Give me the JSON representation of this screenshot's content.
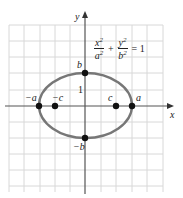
{
  "diagram": {
    "equation": {
      "term1": {
        "num": "x",
        "num_exp": "2",
        "den": "a",
        "den_exp": "2"
      },
      "plus": "+",
      "term2": {
        "num": "y",
        "num_exp": "2",
        "den": "b",
        "den_exp": "2"
      },
      "rhs": "= 1"
    },
    "axes": {
      "x_label": "x",
      "y_label": "y"
    },
    "tick_label": "1",
    "points": [
      {
        "label": "-a",
        "x": -3,
        "y": 0
      },
      {
        "label": "-c",
        "x": -2,
        "y": 0
      },
      {
        "label": "c",
        "x": 2,
        "y": 0
      },
      {
        "label": "a",
        "x": 3,
        "y": 0
      },
      {
        "label": "b",
        "x": 0,
        "y": 2
      },
      {
        "label": "-b",
        "x": 0,
        "y": -2
      }
    ],
    "labels": {
      "neg_a": "−a",
      "neg_c": "−c",
      "c": "c",
      "a": "a",
      "b": "b",
      "neg_b": "−b"
    },
    "colors": {
      "ellipse": "#777777",
      "grid": "#d8d8d8",
      "axis": "#555555",
      "point": "#111111"
    }
  }
}
